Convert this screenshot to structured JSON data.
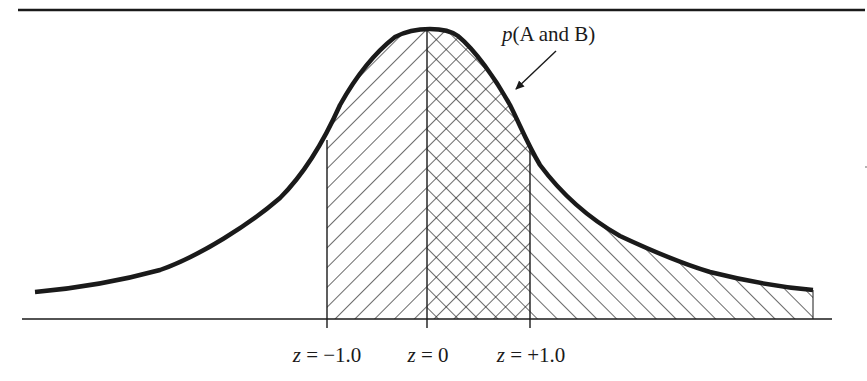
{
  "figure": {
    "type": "normal-distribution-overlap-diagram",
    "annotation": {
      "prefix": "p",
      "text": "(A and B)",
      "full": "p(A and B)",
      "arrow": "pointer-arrow-icon"
    },
    "axis_labels": [
      {
        "var": "z",
        "eq": " = ",
        "value": "−1.0",
        "full": "z = −1.0"
      },
      {
        "var": "z",
        "eq": " = ",
        "value": "0",
        "full": "z = 0"
      },
      {
        "var": "z",
        "eq": " = ",
        "value": "+1.0",
        "full": "z = +1.0"
      }
    ],
    "regions": [
      {
        "name": "A-only",
        "from": "z = −1.0",
        "to": "z = 0",
        "pattern": "diagonal-backslash"
      },
      {
        "name": "A-and-B",
        "from": "z = 0",
        "to": "z = +1.0",
        "pattern": "crosshatch"
      },
      {
        "name": "B-only",
        "from": "z = +1.0",
        "to": "right tail",
        "pattern": "diagonal-forward-slash"
      }
    ],
    "colors": {
      "ink": "#1a1a1a",
      "background": "#ffffff"
    }
  }
}
